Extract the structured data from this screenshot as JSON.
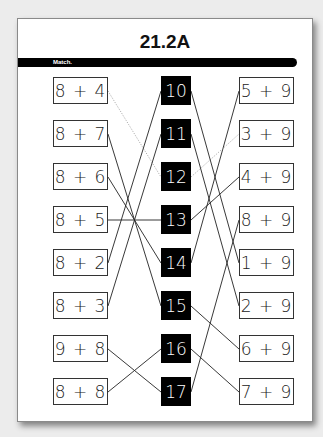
{
  "worksheet": {
    "title": "21.2A",
    "instruction": "Match."
  },
  "left_column": [
    {
      "expr": "8 + 4",
      "matches": "12",
      "example": true
    },
    {
      "expr": "8 + 7",
      "matches": "15"
    },
    {
      "expr": "8 + 6",
      "matches": "14"
    },
    {
      "expr": "8 + 5",
      "matches": "13"
    },
    {
      "expr": "8 + 2",
      "matches": "10"
    },
    {
      "expr": "8 + 3",
      "matches": "11"
    },
    {
      "expr": "9 + 8",
      "matches": "17"
    },
    {
      "expr": "8 + 8",
      "matches": "16"
    }
  ],
  "center_column": [
    "10",
    "11",
    "12",
    "13",
    "14",
    "15",
    "16",
    "17"
  ],
  "right_column": [
    {
      "expr": "5 + 9",
      "matches": "14"
    },
    {
      "expr": "3 + 9",
      "matches": "12",
      "example": true
    },
    {
      "expr": "4 + 9",
      "matches": "13"
    },
    {
      "expr": "8 + 9",
      "matches": "17"
    },
    {
      "expr": "1 + 9",
      "matches": "10"
    },
    {
      "expr": "2 + 9",
      "matches": "11"
    },
    {
      "expr": "6 + 9",
      "matches": "15"
    },
    {
      "expr": "7 + 9",
      "matches": "16"
    }
  ]
}
